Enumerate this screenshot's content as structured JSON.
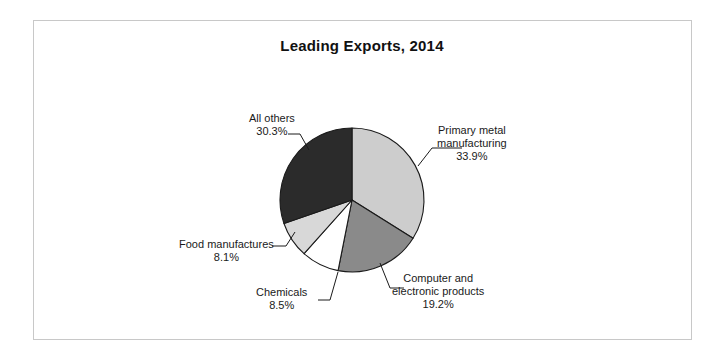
{
  "figure": {
    "title": "Leading Exports, 2014",
    "frame_color": "#c8c8c8",
    "background": "#ffffff"
  },
  "chart_data": {
    "type": "pie",
    "title": "Leading Exports, 2014",
    "xlabel": "",
    "ylabel": "",
    "grid": false,
    "legend_position": "none",
    "labels_position": "outside-with-leader-lines",
    "start_angle_deg": 0,
    "direction": "clockwise",
    "units": "percent",
    "categories": [
      "Primary metal manufacturing",
      "Computer and electronic products",
      "Chemicals",
      "Food manufactures",
      "All others"
    ],
    "values": [
      33.9,
      19.2,
      8.5,
      8.1,
      30.3
    ],
    "value_labels": [
      "33.9%",
      "19.2%",
      "8.5%",
      "8.1%",
      "30.3%"
    ],
    "colors": [
      "#cdcdcd",
      "#8a8a8a",
      "#ffffff",
      "#d8d8d8",
      "#2b2b2b"
    ],
    "slice_border_color": "#1a1a1a",
    "center": {
      "x": 352,
      "y": 200
    },
    "radius": 72,
    "slices": [
      {
        "name": "Primary metal manufacturing",
        "value": 33.9,
        "value_label": "33.9%",
        "color": "#cdcdcd",
        "label_line1": "Primary metal",
        "label_line2": "manufacturing",
        "label_pct": "33.9%"
      },
      {
        "name": "Computer and electronic products",
        "value": 19.2,
        "value_label": "19.2%",
        "color": "#8a8a8a",
        "label_line1": "Computer and",
        "label_line2": "electronic products",
        "label_pct": "19.2%"
      },
      {
        "name": "Chemicals",
        "value": 8.5,
        "value_label": "8.5%",
        "color": "#ffffff",
        "label_line1": "Chemicals",
        "label_line2": "",
        "label_pct": "8.5%"
      },
      {
        "name": "Food manufactures",
        "value": 8.1,
        "value_label": "8.1%",
        "color": "#d8d8d8",
        "label_line1": "Food manufactures",
        "label_line2": "",
        "label_pct": "8.1%"
      },
      {
        "name": "All others",
        "value": 30.3,
        "value_label": "30.3%",
        "color": "#2b2b2b",
        "label_line1": "All others",
        "label_line2": "",
        "label_pct": "30.3%"
      }
    ]
  },
  "leader_lines": [
    {
      "name": "primary-metal-leader",
      "points": "418,166 432,148 462,148"
    },
    {
      "name": "computer-leader",
      "points": "380,263 390,288 404,288"
    },
    {
      "name": "chemicals-leader",
      "points": "338,272 330,300 318,300"
    },
    {
      "name": "food-leader",
      "points": "295,232 286,246 272,246"
    },
    {
      "name": "all-others-leader",
      "points": "309,150 300,134 288,134"
    }
  ]
}
